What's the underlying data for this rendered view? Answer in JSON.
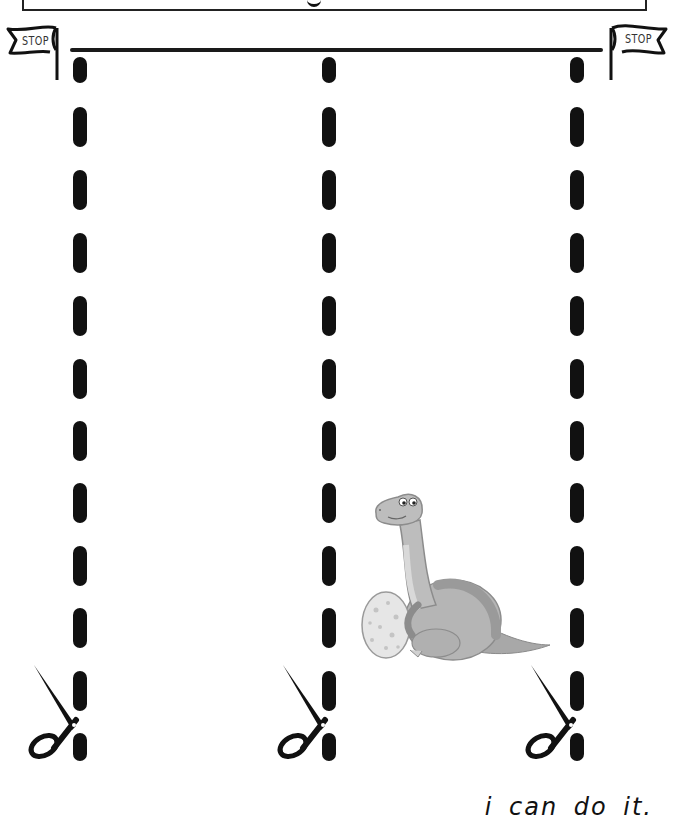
{
  "worksheet": {
    "type": "scissor cutting practice",
    "header_box": {
      "visible_text": ""
    },
    "flags": [
      {
        "position": "left",
        "label": "STOP"
      },
      {
        "position": "right",
        "label": "STOP"
      }
    ],
    "cut_lines": [
      {
        "id": "left",
        "x": 73,
        "dash_count": 11
      },
      {
        "id": "middle",
        "x": 322,
        "dash_count": 11
      },
      {
        "id": "right",
        "x": 570,
        "dash_count": 11
      }
    ],
    "dash_positions_y": [
      57,
      107,
      170,
      233,
      296,
      359,
      421,
      483,
      546,
      608,
      670,
      732
    ],
    "illustration": {
      "name": "dinosaur with egg",
      "color": "#b9b9b9"
    },
    "scissors_icon": "scissors-icon",
    "footer": {
      "text": "i can do it."
    },
    "colors": {
      "ink": "#111111",
      "background": "#ffffff",
      "dino_gray": "#b5b5b5"
    }
  }
}
